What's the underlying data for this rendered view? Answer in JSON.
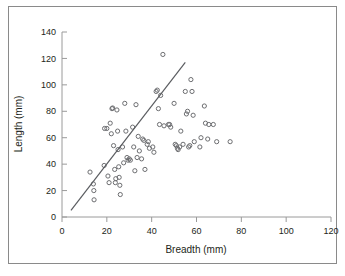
{
  "chart_data": {
    "type": "scatter",
    "title": "",
    "subtitle": "",
    "xlabel": "Breadth (mm)",
    "ylabel": "Length (mm)",
    "xlim": [
      0,
      120
    ],
    "ylim": [
      0,
      140
    ],
    "xticks": [
      0,
      20,
      40,
      60,
      80,
      100,
      120
    ],
    "yticks": [
      0,
      20,
      40,
      60,
      80,
      100,
      120,
      140
    ],
    "xtick_labels": [
      "0",
      "20",
      "40",
      "60",
      "80",
      "100",
      "120"
    ],
    "ytick_labels": [
      "0",
      "20",
      "40",
      "60",
      "80",
      "100",
      "120",
      "140"
    ],
    "grid": false,
    "legend": null,
    "legend_position": "none",
    "marker": {
      "shape": "circle",
      "size": 2.1,
      "color": "#6d6e71",
      "fill": "none",
      "stroke_width": 1.0
    },
    "series": [
      {
        "name": "Stone tools",
        "type": "scatter",
        "points": [
          [
            12.5,
            34
          ],
          [
            14.0,
            25
          ],
          [
            14.2,
            20
          ],
          [
            14.3,
            13
          ],
          [
            18.8,
            39
          ],
          [
            19.0,
            67
          ],
          [
            20.0,
            67
          ],
          [
            20.5,
            31
          ],
          [
            21.0,
            26
          ],
          [
            21.5,
            71
          ],
          [
            22.0,
            63
          ],
          [
            22.3,
            82
          ],
          [
            22.6,
            82.5
          ],
          [
            23.0,
            54
          ],
          [
            23.5,
            36
          ],
          [
            23.8,
            26
          ],
          [
            24.0,
            29
          ],
          [
            24.5,
            81
          ],
          [
            24.8,
            65
          ],
          [
            25.0,
            51
          ],
          [
            25.3,
            38
          ],
          [
            25.5,
            30
          ],
          [
            25.8,
            24
          ],
          [
            26.0,
            17
          ],
          [
            27.0,
            53
          ],
          [
            27.5,
            41
          ],
          [
            28.0,
            86
          ],
          [
            28.5,
            65
          ],
          [
            29.0,
            45
          ],
          [
            29.5,
            43
          ],
          [
            30.0,
            44
          ],
          [
            30.5,
            43
          ],
          [
            31.5,
            68
          ],
          [
            32.0,
            53
          ],
          [
            32.5,
            35
          ],
          [
            33.0,
            85
          ],
          [
            33.5,
            45
          ],
          [
            34.0,
            61
          ],
          [
            34.5,
            50
          ],
          [
            35.5,
            44
          ],
          [
            36.0,
            59
          ],
          [
            36.5,
            58
          ],
          [
            37.0,
            36
          ],
          [
            38.0,
            55
          ],
          [
            38.5,
            57
          ],
          [
            39.0,
            52
          ],
          [
            40.5,
            53
          ],
          [
            41.0,
            49
          ],
          [
            42.0,
            95
          ],
          [
            42.5,
            96
          ],
          [
            43.0,
            82
          ],
          [
            43.5,
            70
          ],
          [
            44.0,
            92
          ],
          [
            45.0,
            123
          ],
          [
            45.5,
            69
          ],
          [
            47.5,
            70
          ],
          [
            48.0,
            70
          ],
          [
            48.5,
            68
          ],
          [
            50.0,
            86
          ],
          [
            50.5,
            55
          ],
          [
            51.0,
            54
          ],
          [
            51.5,
            52
          ],
          [
            51.8,
            51
          ],
          [
            52.5,
            53
          ],
          [
            53.0,
            65
          ],
          [
            54.0,
            55
          ],
          [
            55.0,
            95
          ],
          [
            55.5,
            78
          ],
          [
            56.0,
            80
          ],
          [
            56.5,
            53
          ],
          [
            57.0,
            54
          ],
          [
            57.5,
            104
          ],
          [
            58.0,
            95
          ],
          [
            58.5,
            77
          ],
          [
            59.0,
            57
          ],
          [
            61.5,
            53
          ],
          [
            62.0,
            60
          ],
          [
            63.5,
            84
          ],
          [
            64.0,
            71
          ],
          [
            65.0,
            59
          ],
          [
            65.5,
            70
          ],
          [
            67.5,
            70
          ],
          [
            69.0,
            57
          ],
          [
            75.0,
            57
          ]
        ]
      }
    ],
    "trendline": {
      "name": "linear-fit",
      "color": "#5a5c60",
      "stroke_width": 1.2,
      "x_start": 4,
      "y_start": 5,
      "x_end": 55,
      "y_end": 117
    }
  },
  "axes": {
    "x_axis_label": "Breadth (mm)",
    "y_axis_label": "Length (mm)"
  }
}
